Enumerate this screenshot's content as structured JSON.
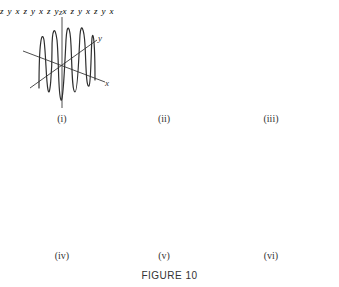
{
  "figure": {
    "title": "FIGURE 10",
    "panels": [
      {
        "caption": "(i)",
        "axes": {
          "z": "z",
          "y": "y",
          "x": "x"
        },
        "description": "helix-like curve oscillating densely around a cylinder"
      },
      {
        "caption": "(ii)",
        "axes": {
          "z": "z",
          "y": "y",
          "x": "x"
        },
        "description": "two hyperbola-like branches through origin"
      },
      {
        "caption": "(iii)",
        "axes": {
          "z": "z",
          "y": "y",
          "x": "x"
        },
        "description": "oscillating curve along diagonal with growing amplitude"
      },
      {
        "caption": "(iv)",
        "axes": {
          "z": "z",
          "y": "y",
          "x": "x"
        },
        "description": "single cusp-like curve through origin"
      },
      {
        "caption": "(v)",
        "axes": {
          "z": "z",
          "y": "y",
          "x": "x"
        },
        "description": "conical spiral expanding along x-axis"
      },
      {
        "caption": "(vi)",
        "axes": {
          "z": "z",
          "y": "y",
          "x": "x"
        },
        "description": "closed looping curve around z-axis"
      }
    ]
  }
}
